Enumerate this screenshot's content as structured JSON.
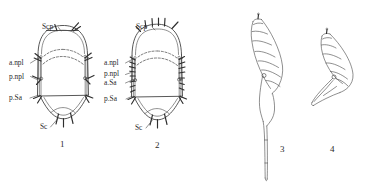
{
  "plate": {
    "title": "Comparative morphology plate",
    "background_color": "#ffffff",
    "ink_color": "#3a3a3a",
    "caption": ""
  },
  "figures": [
    {
      "number": "1",
      "name": "thoracic-sclerite-dorsal-view-1",
      "description": "Dorsal view of mesonotum with rounded scutellum",
      "labels": [
        {
          "id": "scp",
          "text": "Scp",
          "meaning": "scutellum"
        },
        {
          "id": "anpl",
          "text": "a.npl",
          "meaning": "anterior notopleural"
        },
        {
          "id": "pnpl",
          "text": "p.npl",
          "meaning": "posterior notopleural"
        },
        {
          "id": "psa",
          "text": "p.Sa",
          "meaning": "posterior supra-alar"
        },
        {
          "id": "sc",
          "text": "Sc",
          "meaning": "scutum"
        }
      ]
    },
    {
      "number": "2",
      "name": "thoracic-sclerite-dorsal-view-2",
      "description": "Dorsal view of mesonotum, elongate, with numerous bristles",
      "labels": [
        {
          "id": "scp",
          "text": "Scp",
          "meaning": "scutellum"
        },
        {
          "id": "anpl",
          "text": "a.npl",
          "meaning": "anterior notopleural"
        },
        {
          "id": "pnpl",
          "text": "p.npl",
          "meaning": "posterior notopleural"
        },
        {
          "id": "asa",
          "text": "a.Sa",
          "meaning": "anterior supra-alar"
        },
        {
          "id": "psa",
          "text": "p.Sa",
          "meaning": "posterior supra-alar"
        },
        {
          "id": "sc",
          "text": "Sc",
          "meaning": "scutum"
        }
      ]
    },
    {
      "number": "3",
      "name": "segmented-appendage-elongate",
      "description": "Curved segmented appendage with long tapering terminal shaft",
      "labels": []
    },
    {
      "number": "4",
      "name": "segmented-appendage-short",
      "description": "Curved segmented appendage, short, strongly recurved apex",
      "labels": []
    }
  ]
}
